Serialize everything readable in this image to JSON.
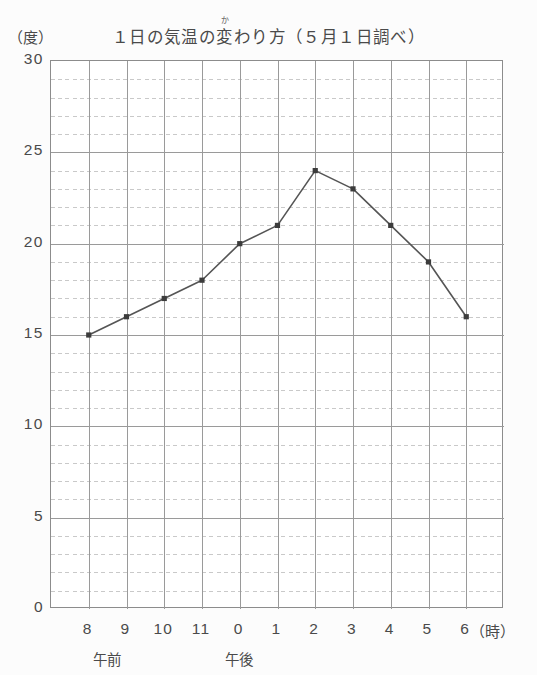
{
  "chart_data": {
    "type": "line",
    "title_parts": {
      "before": "１日の気温の",
      "ruby_base": "変",
      "ruby_text": "か",
      "after": "わり方（５月１日調べ）"
    },
    "xlabel": "（時）",
    "ylabel": "（度）",
    "categories": [
      "8",
      "9",
      "10",
      "11",
      "0",
      "1",
      "2",
      "3",
      "4",
      "5",
      "6"
    ],
    "x_tick_labels": [
      "8",
      "9",
      "10",
      "11",
      "0",
      "1",
      "2",
      "3",
      "4",
      "5",
      "6"
    ],
    "values": [
      15,
      16,
      17,
      18,
      20,
      21,
      24,
      23,
      21,
      19,
      16
    ],
    "y_tick_labels": [
      "30",
      "25",
      "20",
      "15",
      "10",
      "5",
      "0"
    ],
    "y_tick_values": [
      30,
      25,
      20,
      15,
      10,
      5,
      0
    ],
    "ylim": [
      0,
      30
    ],
    "y_major_step": 5,
    "y_minor_step": 1,
    "grid": true,
    "grid_major_color": "#9a9a9a",
    "grid_minor_color": "#c9c9c9",
    "line_color": "#555555",
    "marker_color": "#3c3c3c",
    "marker": "square",
    "legend": "none",
    "period_labels": [
      {
        "text": "午前",
        "at_hour_index": 0.5
      },
      {
        "text": "午後",
        "at_hour_index": 4
      }
    ]
  },
  "axes": {
    "x_unit": "（時）",
    "y_unit": "（度）"
  }
}
